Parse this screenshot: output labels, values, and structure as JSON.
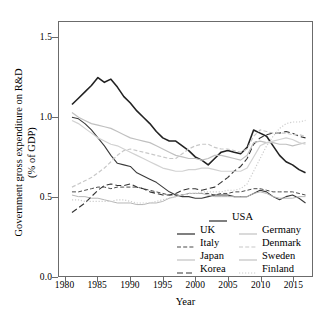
{
  "chart_data": {
    "type": "line",
    "title": "",
    "xlabel": "Year",
    "ylabel": "Government gross expenditure on R&D (% of GDP)",
    "ylabel_line1": "Government gross expenditure on R&D",
    "ylabel_line2": "(% of GDP)",
    "xlim": [
      1979.0,
      1917.0
    ],
    "x_range": [
      1979.0,
      2018.0
    ],
    "ylim": [
      0.0,
      1.6
    ],
    "grid": false,
    "legend_position": "bottom-right",
    "xticks": [
      "1980",
      "1985",
      "1990",
      "1995",
      "2000",
      "2005",
      "2010",
      "2015"
    ],
    "xtick_values": [
      1980,
      1985,
      1990,
      1995,
      2000,
      2005,
      2010,
      2015
    ],
    "yticks": [
      "0.0",
      "0.5",
      "1.0",
      "1.5"
    ],
    "ytick_values": [
      0.0,
      0.5,
      1.0,
      1.5
    ],
    "x": [
      1981,
      1982,
      1983,
      1984,
      1985,
      1986,
      1987,
      1988,
      1989,
      1990,
      1991,
      1992,
      1993,
      1994,
      1995,
      1996,
      1997,
      1998,
      1999,
      2000,
      2001,
      2002,
      2003,
      2004,
      2005,
      2006,
      2007,
      2008,
      2009,
      2010,
      2011,
      2012,
      2013,
      2014,
      2015,
      2016,
      2017
    ],
    "series": [
      {
        "name": "USA",
        "color": "#222222",
        "style": "solid",
        "width": 1.6,
        "values": [
          1.08,
          1.12,
          1.16,
          1.2,
          1.25,
          1.22,
          1.24,
          1.19,
          1.13,
          1.09,
          1.04,
          1.0,
          0.96,
          0.91,
          0.87,
          0.85,
          0.85,
          0.82,
          0.79,
          0.75,
          0.73,
          0.7,
          0.74,
          0.78,
          0.79,
          0.78,
          0.77,
          0.81,
          0.92,
          0.9,
          0.88,
          0.82,
          0.76,
          0.72,
          0.7,
          0.67,
          0.65
        ]
      },
      {
        "name": "UK",
        "color": "#3a3a3a",
        "style": "solid",
        "width": 1.1,
        "values": [
          1.0,
          0.99,
          0.96,
          0.92,
          0.87,
          0.82,
          0.76,
          0.71,
          0.7,
          0.69,
          0.65,
          0.63,
          0.61,
          0.59,
          0.56,
          0.53,
          0.51,
          0.5,
          0.5,
          0.49,
          0.49,
          0.5,
          0.51,
          0.51,
          0.51,
          0.5,
          0.5,
          0.5,
          0.52,
          0.54,
          0.53,
          0.5,
          0.48,
          0.5,
          0.51,
          0.49,
          0.46
        ]
      },
      {
        "name": "Italy",
        "color": "#4a4a4a",
        "style": "dashed",
        "width": 1.0,
        "values": [
          0.53,
          0.53,
          0.54,
          0.55,
          0.56,
          0.56,
          0.55,
          0.56,
          0.56,
          0.56,
          0.56,
          0.55,
          0.54,
          0.53,
          0.52,
          0.51,
          0.51,
          0.51,
          0.52,
          0.52,
          0.52,
          0.52,
          0.51,
          0.52,
          0.52,
          0.53,
          0.53,
          0.54,
          0.55,
          0.55,
          0.54,
          0.53,
          0.53,
          0.53,
          0.53,
          0.52,
          0.51
        ]
      },
      {
        "name": "Japan",
        "color": "#b5b5b5",
        "style": "solid",
        "width": 1.0,
        "values": [
          0.51,
          0.5,
          0.5,
          0.49,
          0.49,
          0.48,
          0.47,
          0.46,
          0.46,
          0.46,
          0.45,
          0.45,
          0.46,
          0.46,
          0.47,
          0.49,
          0.5,
          0.51,
          0.52,
          0.52,
          0.52,
          0.51,
          0.5,
          0.5,
          0.5,
          0.5,
          0.5,
          0.5,
          0.52,
          0.53,
          0.52,
          0.5,
          0.49,
          0.49,
          0.49,
          0.5,
          0.5
        ]
      },
      {
        "name": "Korea",
        "color": "#333333",
        "style": "longdash",
        "width": 1.1,
        "values": [
          0.4,
          0.43,
          0.46,
          0.5,
          0.54,
          0.57,
          0.58,
          0.57,
          0.57,
          0.58,
          0.56,
          0.55,
          0.53,
          0.52,
          0.51,
          0.51,
          0.52,
          0.54,
          0.55,
          0.55,
          0.54,
          0.55,
          0.56,
          0.59,
          0.62,
          0.66,
          0.69,
          0.74,
          0.83,
          0.87,
          0.89,
          0.9,
          0.9,
          0.91,
          0.9,
          0.88,
          0.87
        ]
      },
      {
        "name": "Germany",
        "color": "#c0c0c0",
        "style": "solid",
        "width": 1.2,
        "values": [
          1.03,
          1.0,
          0.98,
          0.96,
          0.95,
          0.94,
          0.93,
          0.91,
          0.89,
          0.87,
          0.86,
          0.85,
          0.84,
          0.82,
          0.8,
          0.78,
          0.76,
          0.75,
          0.74,
          0.74,
          0.73,
          0.74,
          0.76,
          0.76,
          0.75,
          0.74,
          0.73,
          0.76,
          0.84,
          0.85,
          0.84,
          0.84,
          0.83,
          0.83,
          0.82,
          0.83,
          0.84
        ]
      },
      {
        "name": "Denmark",
        "color": "#c8c8c8",
        "style": "dashed",
        "width": 1.2,
        "values": [
          0.56,
          0.58,
          0.6,
          0.62,
          0.65,
          0.68,
          0.72,
          0.76,
          0.79,
          0.8,
          0.79,
          0.78,
          0.77,
          0.76,
          0.75,
          0.74,
          0.74,
          0.77,
          0.8,
          0.82,
          0.83,
          0.83,
          0.81,
          0.8,
          0.8,
          0.79,
          0.78,
          0.8,
          0.88,
          0.92,
          0.91,
          0.9,
          0.9,
          0.9,
          0.89,
          0.89,
          0.88
        ]
      },
      {
        "name": "Sweden",
        "color": "#d2d2d2",
        "style": "solid",
        "width": 1.2,
        "values": [
          0.98,
          0.96,
          0.93,
          0.9,
          0.87,
          0.85,
          0.83,
          0.82,
          0.8,
          0.78,
          0.76,
          0.74,
          0.72,
          0.7,
          0.68,
          0.67,
          0.66,
          0.66,
          0.67,
          0.67,
          0.68,
          0.68,
          0.67,
          0.66,
          0.66,
          0.66,
          0.66,
          0.68,
          0.75,
          0.82,
          0.84,
          0.85,
          0.86,
          0.87,
          0.86,
          0.84,
          0.83
        ]
      },
      {
        "name": "Finland",
        "color": "#cccccc",
        "style": "dotted",
        "width": 1.2,
        "values": [
          0.48,
          0.48,
          0.47,
          0.47,
          0.47,
          0.47,
          0.47,
          0.48,
          0.48,
          0.47,
          0.46,
          0.46,
          0.46,
          0.47,
          0.48,
          0.49,
          0.5,
          0.51,
          0.52,
          0.52,
          0.53,
          0.53,
          0.53,
          0.53,
          0.54,
          0.54,
          0.55,
          0.58,
          0.66,
          0.74,
          0.82,
          0.88,
          0.93,
          0.96,
          0.97,
          0.97,
          0.98
        ]
      }
    ]
  },
  "legend": {
    "top_entry": {
      "label": "USA",
      "sample": "solid-dark"
    },
    "left_column": [
      {
        "label": "UK",
        "sample": "solid-dark"
      },
      {
        "label": "Italy",
        "sample": "dashed-dark"
      },
      {
        "label": "Japan",
        "sample": "solid-light"
      },
      {
        "label": "Korea",
        "sample": "longdash-dark"
      }
    ],
    "right_column": [
      {
        "label": "Germany",
        "sample": "solid-light"
      },
      {
        "label": "Denmark",
        "sample": "dashed-light"
      },
      {
        "label": "Sweden",
        "sample": "solid-light"
      },
      {
        "label": "Finland",
        "sample": "dotted-light"
      }
    ]
  },
  "axes": {
    "x_title": "Year",
    "y_title_line1": "Government gross expenditure on R&D",
    "y_title_line2": "(% of GDP)"
  },
  "colors": {
    "frame": "#6b6b6b",
    "background": "#ffffff",
    "text": "#000000",
    "usa": "#222222",
    "light_series": "#c8c8c8"
  }
}
